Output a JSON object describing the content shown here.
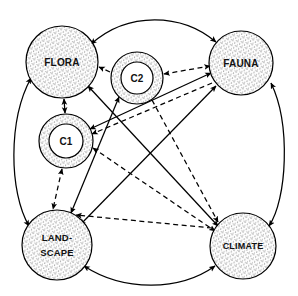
{
  "diagram": {
    "background_color": "#ffffff",
    "line_color": "#000000",
    "fill_pattern": "stipple",
    "width": 298,
    "height": 296,
    "nodes": [
      {
        "id": "flora",
        "label": "FLORA",
        "label_line2": "",
        "shape": "circle",
        "cx": 62,
        "cy": 62,
        "r": 36,
        "inner_r": 0
      },
      {
        "id": "fauna",
        "label": "FAUNA",
        "label_line2": "",
        "shape": "circle",
        "cx": 241,
        "cy": 63,
        "r": 32,
        "inner_r": 0
      },
      {
        "id": "landscape",
        "label": "LAND-",
        "label_line2": "SCAPE",
        "shape": "circle",
        "cx": 57,
        "cy": 245,
        "r": 35,
        "inner_r": 0
      },
      {
        "id": "climate",
        "label": "CLIMATE",
        "label_line2": "",
        "shape": "circle",
        "cx": 243,
        "cy": 246,
        "r": 33,
        "inner_r": 0
      },
      {
        "id": "c1",
        "label": "C1",
        "label_line2": "",
        "shape": "double-circle",
        "cx": 66,
        "cy": 141,
        "r": 27,
        "inner_r": 17
      },
      {
        "id": "c2",
        "label": "C2",
        "label_line2": "",
        "shape": "double-circle",
        "cx": 137,
        "cy": 78,
        "r": 26,
        "inner_r": 16
      }
    ],
    "edges": [
      {
        "from": "flora",
        "to": "fauna",
        "style": "solid",
        "arrows": "both",
        "routing": "arc-outer-top"
      },
      {
        "from": "landscape",
        "to": "climate",
        "style": "solid",
        "arrows": "both",
        "routing": "arc-outer-bottom"
      },
      {
        "from": "flora",
        "to": "landscape",
        "style": "solid",
        "arrows": "both",
        "routing": "arc-outer-left"
      },
      {
        "from": "fauna",
        "to": "climate",
        "style": "solid",
        "arrows": "both",
        "routing": "arc-outer-right"
      },
      {
        "from": "flora",
        "to": "c1",
        "style": "solid",
        "arrows": "both",
        "routing": "straight"
      },
      {
        "from": "flora",
        "to": "climate",
        "style": "solid",
        "arrows": "both",
        "routing": "straight"
      },
      {
        "from": "fauna",
        "to": "landscape",
        "style": "solid",
        "arrows": "both",
        "routing": "straight"
      },
      {
        "from": "c2",
        "to": "landscape",
        "style": "solid",
        "arrows": "both",
        "routing": "straight"
      },
      {
        "from": "c1",
        "to": "fauna",
        "style": "solid",
        "arrows": "both",
        "routing": "straight"
      },
      {
        "from": "c2",
        "to": "flora",
        "style": "dashed",
        "arrows": "to",
        "routing": "straight"
      },
      {
        "from": "fauna",
        "to": "c2",
        "style": "dashed",
        "arrows": "both",
        "routing": "straight"
      },
      {
        "from": "c1",
        "to": "landscape",
        "style": "dashed",
        "arrows": "both",
        "routing": "straight"
      },
      {
        "from": "c1",
        "to": "climate",
        "style": "dashed",
        "arrows": "both",
        "routing": "straight"
      },
      {
        "from": "c2",
        "to": "climate",
        "style": "dashed",
        "arrows": "to",
        "routing": "straight"
      },
      {
        "from": "fauna",
        "to": "c1",
        "style": "dashed",
        "arrows": "to",
        "routing": "straight"
      },
      {
        "from": "climate",
        "to": "landscape",
        "style": "dashed",
        "arrows": "to",
        "routing": "straight"
      }
    ],
    "legend": {
      "solid_meaning": "solid-arrow",
      "dashed_meaning": "dashed-arrow"
    }
  }
}
